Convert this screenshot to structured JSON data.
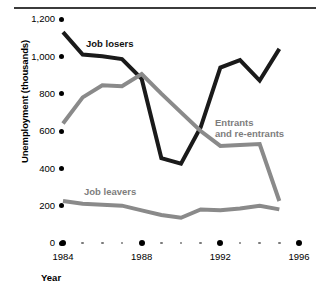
{
  "chart_data": {
    "type": "line",
    "title": "",
    "xlabel": "Year",
    "ylabel": "Unemployment (thousands)",
    "x": [
      1984,
      1985,
      1986,
      1987,
      1988,
      1989,
      1990,
      1991,
      1992,
      1993,
      1994,
      1995
    ],
    "xlim": [
      1984,
      1996
    ],
    "ylim": [
      0,
      1200
    ],
    "yticks": [
      0,
      200,
      400,
      600,
      800,
      1000,
      1200
    ],
    "ytick_labels": [
      "0",
      "200",
      "400",
      "600",
      "800",
      "1,000",
      "1,200"
    ],
    "xticks": [
      1984,
      1985,
      1986,
      1987,
      1988,
      1989,
      1990,
      1991,
      1992,
      1993,
      1994,
      1995,
      1996
    ],
    "xtick_labels": [
      "1984",
      "1988",
      "1992",
      "1996"
    ],
    "xtick_major": [
      1984,
      1988,
      1992,
      1996
    ],
    "grid": false,
    "legend": "inline-labels",
    "series": [
      {
        "name": "Job losers",
        "color": "#1a1a1a",
        "values": [
          1130,
          1010,
          1000,
          985,
          880,
          455,
          425,
          620,
          940,
          980,
          870,
          1040
        ]
      },
      {
        "name": "Entrants and re-entrants",
        "color": "#8a8a8a",
        "values": [
          640,
          780,
          845,
          840,
          905,
          800,
          700,
          600,
          520,
          525,
          530,
          225
        ]
      },
      {
        "name": "Job leavers",
        "color": "#8a8a8a",
        "values": [
          225,
          210,
          205,
          200,
          175,
          150,
          135,
          180,
          175,
          185,
          200,
          180
        ]
      }
    ]
  },
  "annotations": {
    "job_losers_label": "Job losers",
    "entrants_label_line1": "Entrants",
    "entrants_label_line2": "and re-entrants",
    "job_leavers_label": "Job leavers"
  },
  "colors": {
    "series_dark": "#1a1a1a",
    "series_gray": "#8a8a8a",
    "rule": "#3b3b3b",
    "tick": "#000000",
    "minor_tick": "#7a7a7a",
    "background": "#ffffff"
  }
}
